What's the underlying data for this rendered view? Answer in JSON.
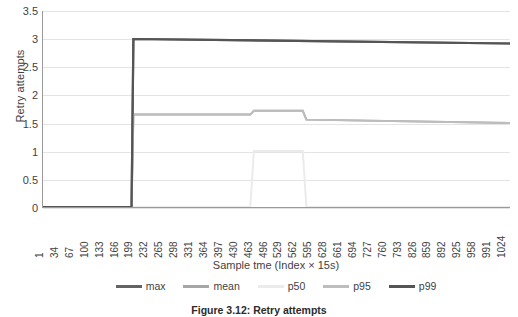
{
  "chart_data": {
    "type": "line",
    "title": "",
    "xlabel": "Sample tme (Index × 15s)",
    "ylabel": "Retry attempts",
    "ylim": [
      0,
      3.5
    ],
    "ytick_values": [
      0,
      0.5,
      1,
      1.5,
      2,
      2.5,
      3,
      3.5
    ],
    "ytick_labels": [
      "0",
      "0.5",
      "1",
      "1.5",
      "2",
      "2.5",
      "3",
      "3.5"
    ],
    "grid": true,
    "legend_position": "bottom",
    "xlim": [
      1,
      1024
    ],
    "x_tick_labels": [
      "1",
      "34",
      "67",
      "100",
      "133",
      "166",
      "199",
      "232",
      "265",
      "298",
      "331",
      "364",
      "397",
      "430",
      "463",
      "496",
      "529",
      "562",
      "595",
      "628",
      "661",
      "694",
      "727",
      "760",
      "793",
      "826",
      "859",
      "892",
      "925",
      "958",
      "991",
      "1024"
    ],
    "series": [
      {
        "name": "max",
        "color": "#636363",
        "width": 2.2,
        "x": [
          1,
          195,
          199,
          1024
        ],
        "values": [
          0,
          0,
          3,
          2.92
        ]
      },
      {
        "name": "mean",
        "color": "#a6a6a6",
        "width": 2.0,
        "x": [
          1,
          195,
          199,
          455,
          463,
          570,
          578,
          1024
        ],
        "values": [
          0,
          0,
          1.65,
          1.65,
          1.72,
          1.72,
          1.56,
          1.5
        ]
      },
      {
        "name": "p50",
        "color": "#ebebeb",
        "width": 2.0,
        "x": [
          1,
          195,
          199,
          455,
          463,
          570,
          578,
          1024
        ],
        "values": [
          0,
          0,
          0,
          0,
          1,
          1,
          0,
          0
        ]
      },
      {
        "name": "p95",
        "color": "#bdbdbd",
        "width": 2.0,
        "x": [
          1,
          195,
          199,
          455,
          463,
          570,
          578,
          1024
        ],
        "values": [
          0,
          0,
          1.65,
          1.65,
          1.72,
          1.72,
          1.56,
          1.5
        ]
      },
      {
        "name": "p99",
        "color": "#555555",
        "width": 2.2,
        "x": [
          1,
          195,
          199,
          1024
        ],
        "values": [
          0,
          0,
          3,
          2.92
        ]
      }
    ]
  },
  "axes": {
    "y_title": "Retry attempts",
    "x_title": "Sample tme (Index × 15s)"
  },
  "legend": {
    "items": [
      {
        "label": "max",
        "color": "#636363"
      },
      {
        "label": "mean",
        "color": "#a6a6a6"
      },
      {
        "label": "p50",
        "color": "#ebebeb"
      },
      {
        "label": "p95",
        "color": "#bdbdbd"
      },
      {
        "label": "p99",
        "color": "#555555"
      }
    ]
  },
  "caption": {
    "text": "Figure 3.12: Retry attempts"
  }
}
